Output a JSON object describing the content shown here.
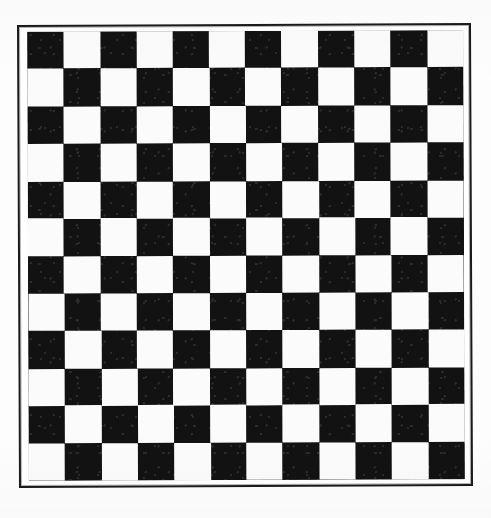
{
  "document": {
    "title": "Checkerboard",
    "kind": "checkerboard-pattern-image",
    "background_color": "#fdfdfd"
  },
  "frame": {
    "name": "outer-border",
    "stroke_color": "#1a1a1a",
    "stroke_width_px": 2.5,
    "x": 18,
    "y": 24,
    "width": 454,
    "height": 463
  },
  "board": {
    "name": "checkerboard",
    "rows": 12,
    "columns": 12,
    "total_cells": 144,
    "top_left_cell_color": "dark",
    "dark_color": "#121212",
    "light_color": "#fbfbfb",
    "x": 28,
    "y": 31,
    "width": 436,
    "height": 449,
    "cell_width_px": 36.3,
    "cell_height_px": 37.4,
    "rotation_deg": -0.2,
    "pattern": [
      [
        "dark",
        "light",
        "dark",
        "light",
        "dark",
        "light",
        "dark",
        "light",
        "dark",
        "light",
        "dark",
        "light"
      ],
      [
        "light",
        "dark",
        "light",
        "dark",
        "light",
        "dark",
        "light",
        "dark",
        "light",
        "dark",
        "light",
        "dark"
      ],
      [
        "dark",
        "light",
        "dark",
        "light",
        "dark",
        "light",
        "dark",
        "light",
        "dark",
        "light",
        "dark",
        "light"
      ],
      [
        "light",
        "dark",
        "light",
        "dark",
        "light",
        "dark",
        "light",
        "dark",
        "light",
        "dark",
        "light",
        "dark"
      ],
      [
        "dark",
        "light",
        "dark",
        "light",
        "dark",
        "light",
        "dark",
        "light",
        "dark",
        "light",
        "dark",
        "light"
      ],
      [
        "light",
        "dark",
        "light",
        "dark",
        "light",
        "dark",
        "light",
        "dark",
        "light",
        "dark",
        "light",
        "dark"
      ],
      [
        "dark",
        "light",
        "dark",
        "light",
        "dark",
        "light",
        "dark",
        "light",
        "dark",
        "light",
        "dark",
        "light"
      ],
      [
        "light",
        "dark",
        "light",
        "dark",
        "light",
        "dark",
        "light",
        "dark",
        "light",
        "dark",
        "light",
        "dark"
      ],
      [
        "dark",
        "light",
        "dark",
        "light",
        "dark",
        "light",
        "dark",
        "light",
        "dark",
        "light",
        "dark",
        "light"
      ],
      [
        "light",
        "dark",
        "light",
        "dark",
        "light",
        "dark",
        "light",
        "dark",
        "light",
        "dark",
        "light",
        "dark"
      ],
      [
        "dark",
        "light",
        "dark",
        "light",
        "dark",
        "light",
        "dark",
        "light",
        "dark",
        "light",
        "dark",
        "light"
      ],
      [
        "light",
        "dark",
        "light",
        "dark",
        "light",
        "dark",
        "light",
        "dark",
        "light",
        "dark",
        "light",
        "dark"
      ]
    ]
  }
}
